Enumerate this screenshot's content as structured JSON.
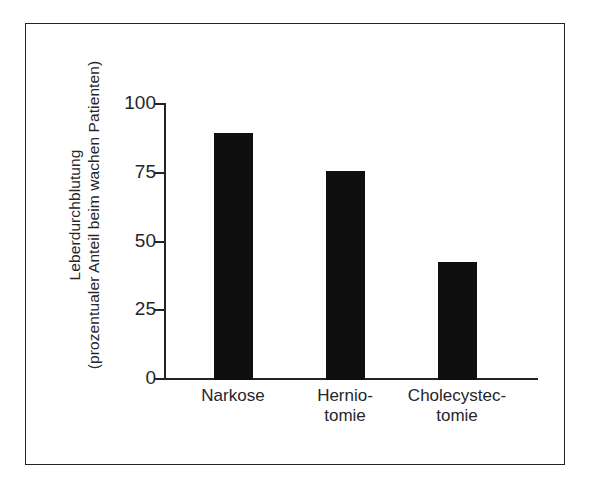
{
  "figure": {
    "background_color": "#ffffff",
    "frame_color": "#23232a",
    "bar_color": "#100f0f"
  },
  "chart_data": {
    "type": "bar",
    "title": "",
    "xlabel": "",
    "ylabel_lines": [
      "Leberdurchblutung",
      "(prozentualer Anteil beim wachen Patienten)"
    ],
    "categories": [
      "Narkose",
      "Hernio-tomie",
      "Cholecystec-tomie"
    ],
    "category_lines": [
      [
        "Narkose"
      ],
      [
        "Hernio-",
        "tomie"
      ],
      [
        "Cholecystec-",
        "tomie"
      ]
    ],
    "values": [
      90,
      76,
      43
    ],
    "ylim": [
      0,
      100
    ],
    "yticks": [
      0,
      25,
      50,
      75,
      100
    ],
    "ytick_labels": [
      "0",
      "25",
      "50",
      "75",
      "100"
    ],
    "grid": false,
    "legend": false
  }
}
